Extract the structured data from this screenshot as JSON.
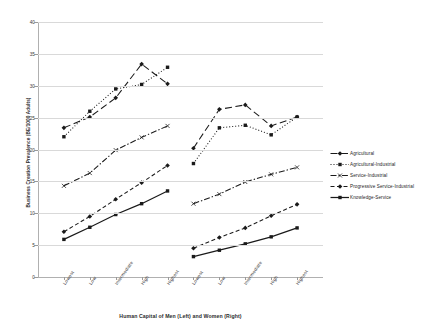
{
  "chart_data": {
    "type": "line",
    "title": "",
    "xlabel": "Human Capital of Men (Left) and Women (Right)",
    "ylabel": "Business Creation Prevalence (BE/1000 Adults)",
    "ylim": [
      0,
      40
    ],
    "yticks": [
      0,
      5,
      10,
      15,
      20,
      25,
      30,
      35,
      40
    ],
    "grid": true,
    "legend_position": "right",
    "categories": [
      "Lowest",
      "Low",
      "Intermediate",
      "High",
      "Highest",
      "Lowest",
      "Low",
      "Intermediate",
      "High",
      "Highest"
    ],
    "group_labels": [
      "Men (Left)",
      "Women (Right)"
    ],
    "series": [
      {
        "name": "Agricultural",
        "marker": "diamond",
        "dash": "long-dash",
        "values_men": [
          23.4,
          25.1,
          28.1,
          33.4,
          30.3
        ],
        "values_women": [
          20.2,
          26.3,
          27.0,
          23.7,
          25.1
        ]
      },
      {
        "name": "Agricultural-Industrial",
        "marker": "square",
        "dash": "dotted",
        "values_men": [
          22.0,
          26.0,
          29.5,
          30.2,
          32.9
        ],
        "values_women": [
          17.8,
          23.4,
          23.8,
          22.3,
          25.1
        ]
      },
      {
        "name": "Service-Industrial",
        "marker": "cross",
        "dash": "dash-dot",
        "values_men": [
          14.3,
          16.3,
          19.9,
          21.9,
          23.7
        ],
        "values_women": [
          11.5,
          13.0,
          14.9,
          16.1,
          17.2
        ]
      },
      {
        "name": "Progressive Service-Industrial",
        "marker": "diamond",
        "dash": "dashed",
        "values_men": [
          7.1,
          9.5,
          12.2,
          14.8,
          17.5
        ],
        "values_women": [
          4.5,
          6.2,
          7.7,
          9.6,
          11.4
        ]
      },
      {
        "name": "Knowledge-Service",
        "marker": "square",
        "dash": "solid",
        "values_men": [
          5.9,
          7.8,
          9.8,
          11.5,
          13.5
        ],
        "values_women": [
          3.2,
          4.2,
          5.2,
          6.3,
          7.7
        ]
      }
    ]
  },
  "legend": {
    "items": [
      {
        "label": "Agricultural"
      },
      {
        "label": "Agricultural-Industrial"
      },
      {
        "label": "Service-Industrial"
      },
      {
        "label": "Progressive Service-Industrial"
      },
      {
        "label": "Knowledge-Service"
      }
    ]
  },
  "axes": {
    "y_title": "Business Creation Prevalence (BE/1000 Adults)",
    "x_title": "Human Capital of Men (Left) and Women (Right)",
    "y_tick_labels": [
      "0",
      "5",
      "10",
      "15",
      "20",
      "25",
      "30",
      "35",
      "40"
    ],
    "x_tick_labels": [
      "Lowest",
      "Low",
      "Intermediate",
      "High",
      "Highest",
      "Lowest",
      "Low",
      "Intermediate",
      "High",
      "Highest"
    ]
  },
  "style": {
    "line_color": "#1a1a1a",
    "grid_color": "#d9d9d9",
    "axis_color": "#b0b0b0",
    "background": "#ffffff"
  }
}
